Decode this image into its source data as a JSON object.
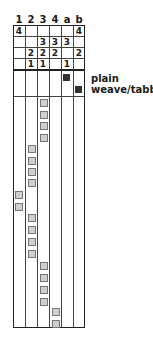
{
  "columns": [
    "1",
    "2",
    "3",
    "4",
    "a",
    "b"
  ],
  "threading_header": {
    "rows": [
      [
        "4",
        "",
        "",
        "",
        "",
        "4"
      ],
      [
        "",
        "",
        "3",
        "3",
        "3",
        ""
      ],
      [
        "",
        "2",
        "2",
        "2",
        "",
        "2"
      ],
      [
        "",
        "1",
        "1",
        "",
        "1",
        ""
      ]
    ]
  },
  "tieup_label": {
    "line1": "plain",
    "line2": "weave/tabby"
  },
  "tieup_marks": [
    {
      "column": "a",
      "row": 1
    },
    {
      "column": "b",
      "row": 2
    }
  ],
  "treadling_sequence": [
    "3",
    "3",
    "3",
    "3",
    "2",
    "2",
    "2",
    "2",
    "1",
    "1",
    "2",
    "2",
    "2",
    "2",
    "3",
    "3",
    "3",
    "3",
    "4",
    "4"
  ],
  "colors": {
    "line": "#222222",
    "tieup_mark": "#333333",
    "treadle_mark_fill": "#cfcfcf",
    "treadle_mark_border": "#777777"
  }
}
